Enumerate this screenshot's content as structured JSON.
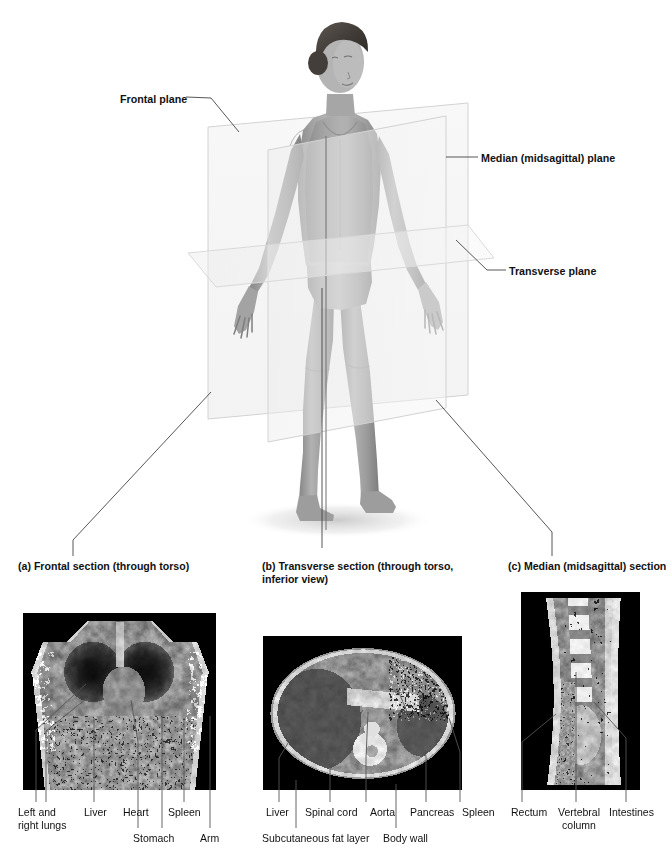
{
  "figure": {
    "background_color": "#ffffff",
    "text_color": "#111111",
    "leader_line_color": "#444444",
    "plane_edge_color": "#cfcfcf"
  },
  "plane_labels": [
    {
      "id": "frontal-plane",
      "text": "Frontal plane",
      "x": 120,
      "y": 93
    },
    {
      "id": "median-midsagittal-plane",
      "text": "Median (midsagittal) plane",
      "x": 481,
      "y": 152
    },
    {
      "id": "transverse-plane",
      "text": "Transverse plane",
      "x": 509,
      "y": 265
    }
  ],
  "sections": [
    {
      "id": "frontal-section",
      "caption": "(a) Frontal section (through torso)",
      "caption_x": 18,
      "caption_y": 560,
      "scan_type": "coronal",
      "labels": [
        {
          "text": "Left and\nright lungs",
          "x": 18,
          "y": 806
        },
        {
          "text": "Liver",
          "x": 84,
          "y": 806
        },
        {
          "text": "Heart",
          "x": 123,
          "y": 806
        },
        {
          "text": "Stomach",
          "x": 133,
          "y": 832
        },
        {
          "text": "Spleen",
          "x": 168,
          "y": 806
        },
        {
          "text": "Arm",
          "x": 200,
          "y": 832
        }
      ]
    },
    {
      "id": "transverse-section",
      "caption": "(b) Transverse section (through torso,\n      inferior view)",
      "caption_x": 262,
      "caption_y": 560,
      "scan_type": "axial",
      "labels": [
        {
          "text": "Liver",
          "x": 266,
          "y": 806
        },
        {
          "text": "Subcutaneous fat layer",
          "x": 262,
          "y": 832
        },
        {
          "text": "Spinal cord",
          "x": 305,
          "y": 806
        },
        {
          "text": "Aorta",
          "x": 370,
          "y": 806
        },
        {
          "text": "Body wall",
          "x": 383,
          "y": 832
        },
        {
          "text": "Pancreas",
          "x": 410,
          "y": 806
        },
        {
          "text": "Spleen",
          "x": 462,
          "y": 806
        }
      ]
    },
    {
      "id": "median-midsagittal-section",
      "caption": "(c) Median (midsagittal) section",
      "caption_x": 508,
      "caption_y": 560,
      "scan_type": "sagittal",
      "labels": [
        {
          "text": "Rectum",
          "x": 511,
          "y": 806
        },
        {
          "text": "Vertebral\ncolumn",
          "x": 561,
          "y": 806
        },
        {
          "text": "Intestines",
          "x": 615,
          "y": 806
        }
      ]
    }
  ],
  "subject": {
    "description": "Standing female figure in anatomical position, anterior view",
    "skin_tone": "#9a9a9a"
  }
}
